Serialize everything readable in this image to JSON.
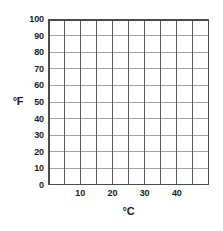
{
  "chart_data": {
    "type": "line",
    "title": "",
    "subtitle": "",
    "xlabel": "°C",
    "ylabel": "°F",
    "xlim": [
      0,
      50
    ],
    "ylim": [
      0,
      100
    ],
    "x_tick_labels": [
      "10",
      "20",
      "30",
      "40"
    ],
    "x_tick_values": [
      10,
      20,
      30,
      40
    ],
    "x_major_step": 10,
    "x_grid_step": 5,
    "y_tick_labels": [
      "100",
      "90",
      "80",
      "70",
      "60",
      "50",
      "40",
      "30",
      "20",
      "10",
      "0"
    ],
    "y_tick_values": [
      100,
      90,
      80,
      70,
      60,
      50,
      40,
      30,
      20,
      10,
      0
    ],
    "y_major_step": 10,
    "grid": true,
    "grid_columns": 10,
    "grid_rows": 10,
    "legend": [],
    "series": [],
    "annotations": [],
    "colors": {
      "background": "#ffffff",
      "border": "#4a4a4a",
      "vertical_grid": "#5b5b5b",
      "horizontal_grid": "#a3a3a3",
      "text": "#1c1c1c"
    }
  }
}
